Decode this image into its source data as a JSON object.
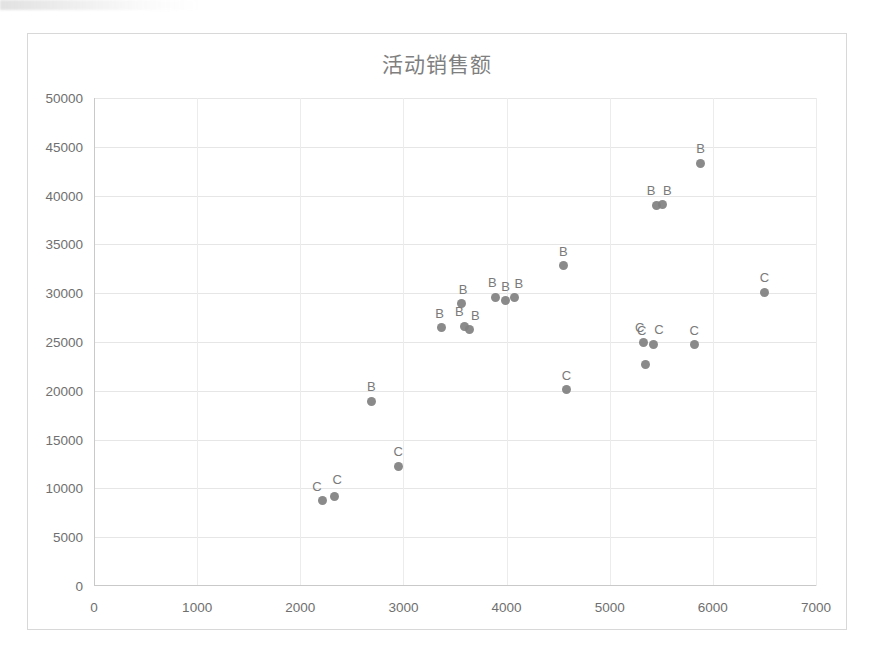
{
  "chart_data": {
    "type": "scatter",
    "title": "活动销售额",
    "xlabel": "",
    "ylabel": "",
    "xlim": [
      0,
      7000
    ],
    "ylim": [
      0,
      50000
    ],
    "xticks": [
      "0",
      "1000",
      "2000",
      "3000",
      "4000",
      "5000",
      "6000",
      "7000"
    ],
    "yticks": [
      "0",
      "5000",
      "10000",
      "15000",
      "20000",
      "25000",
      "30000",
      "35000",
      "40000",
      "45000",
      "50000"
    ],
    "grid": true,
    "legend": "none",
    "marker_color": "#808080",
    "points": [
      {
        "label": "C",
        "x": 2220,
        "y": 8800
      },
      {
        "label": "C",
        "x": 2330,
        "y": 9200
      },
      {
        "label": "B",
        "x": 2690,
        "y": 18950
      },
      {
        "label": "C",
        "x": 2950,
        "y": 12250
      },
      {
        "label": "B",
        "x": 3370,
        "y": 26450
      },
      {
        "label": "B",
        "x": 3560,
        "y": 28900
      },
      {
        "label": "B",
        "x": 3590,
        "y": 26600
      },
      {
        "label": "B",
        "x": 3640,
        "y": 26250
      },
      {
        "label": "B",
        "x": 3890,
        "y": 29600
      },
      {
        "label": "B",
        "x": 3990,
        "y": 29250
      },
      {
        "label": "B",
        "x": 4080,
        "y": 29550
      },
      {
        "label": "C",
        "x": 4580,
        "y": 20100
      },
      {
        "label": "B",
        "x": 4550,
        "y": 32800
      },
      {
        "label": "C",
        "x": 5330,
        "y": 25000
      },
      {
        "label": "C",
        "x": 5350,
        "y": 22700
      },
      {
        "label": "C",
        "x": 5420,
        "y": 24750
      },
      {
        "label": "B",
        "x": 5450,
        "y": 39000
      },
      {
        "label": "B",
        "x": 5510,
        "y": 39050
      },
      {
        "label": "C",
        "x": 5820,
        "y": 24700
      },
      {
        "label": "B",
        "x": 5880,
        "y": 43300
      },
      {
        "label": "C",
        "x": 6500,
        "y": 30100
      }
    ],
    "label_offsets": [
      {
        "dx": -6,
        "dy": -6
      },
      {
        "dx": 3,
        "dy": -9
      },
      {
        "dx": 0,
        "dy": -7
      },
      {
        "dx": 0,
        "dy": -7
      },
      {
        "dx": -2,
        "dy": -7
      },
      {
        "dx": 2,
        "dy": -7
      },
      {
        "dx": -5,
        "dy": -7
      },
      {
        "dx": 6,
        "dy": -7
      },
      {
        "dx": -3,
        "dy": -7
      },
      {
        "dx": 0,
        "dy": -7
      },
      {
        "dx": 4,
        "dy": -7
      },
      {
        "dx": 0,
        "dy": -7
      },
      {
        "dx": 0,
        "dy": -7
      },
      {
        "dx": -4,
        "dy": -7
      },
      {
        "dx": -4,
        "dy": -26
      },
      {
        "dx": 6,
        "dy": -7
      },
      {
        "dx": -5,
        "dy": -7
      },
      {
        "dx": 5,
        "dy": -7
      },
      {
        "dx": 0,
        "dy": -7
      },
      {
        "dx": 0,
        "dy": -7
      },
      {
        "dx": 0,
        "dy": -7
      }
    ]
  }
}
